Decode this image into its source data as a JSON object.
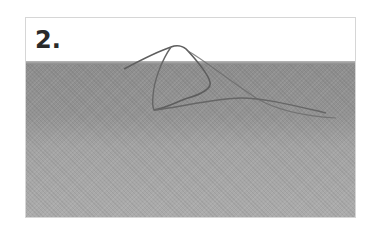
{
  "figure": {
    "step_label": "2.",
    "colors": {
      "frame_border": "#d6d6d6",
      "background": "#ffffff",
      "fabric": "#999999",
      "thread": "#5a5a5a",
      "label": "#2a2a2a"
    }
  }
}
